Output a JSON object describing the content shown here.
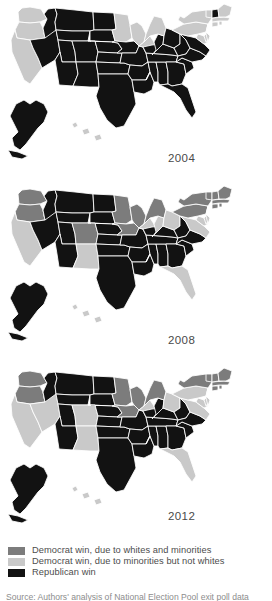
{
  "figure": {
    "caption": "Source: Authors' analysis of National Election Pool exit poll data"
  },
  "colors": {
    "dem_whites_and_minorities": "#7c7c7c",
    "dem_minorities_not_whites": "#c9c9c9",
    "republican": "#121212",
    "border": "#ffffff",
    "background": "#ffffff",
    "text": "#4d4d4d"
  },
  "legend": {
    "name": "map-legend",
    "items": [
      {
        "swatch_color": "#7c7c7c",
        "label": "Democrat win, due to whites and minorities",
        "key": "dem_whites_and_minorities"
      },
      {
        "swatch_color": "#c9c9c9",
        "label": "Democrat win, due to minorities but not whites",
        "key": "dem_minorities_not_whites"
      },
      {
        "swatch_color": "#121212",
        "label": "Republican win",
        "key": "republican"
      }
    ]
  },
  "panels": [
    {
      "id": "panel-2004",
      "year_label": "2004",
      "states": {
        "WA": "dem_minorities_not_whites",
        "OR": "dem_minorities_not_whites",
        "CA": "dem_minorities_not_whites",
        "NV": "republican",
        "ID": "republican",
        "MT": "republican",
        "WY": "republican",
        "UT": "republican",
        "AZ": "republican",
        "CO": "republican",
        "NM": "republican",
        "ND": "republican",
        "SD": "republican",
        "NE": "republican",
        "KS": "republican",
        "OK": "republican",
        "TX": "republican",
        "MN": "dem_minorities_not_whites",
        "IA": "republican",
        "MO": "republican",
        "AR": "republican",
        "LA": "republican",
        "WI": "dem_minorities_not_whites",
        "IL": "dem_minorities_not_whites",
        "MS": "republican",
        "AL": "republican",
        "TN": "republican",
        "KY": "republican",
        "IN": "republican",
        "MI": "dem_minorities_not_whites",
        "OH": "republican",
        "WV": "republican",
        "GA": "republican",
        "FL": "republican",
        "SC": "republican",
        "NC": "republican",
        "VA": "republican",
        "MD": "dem_minorities_not_whites",
        "DE": "dem_minorities_not_whites",
        "PA": "dem_minorities_not_whites",
        "NJ": "dem_minorities_not_whites",
        "NY": "dem_minorities_not_whites",
        "CT": "dem_minorities_not_whites",
        "RI": "dem_minorities_not_whites",
        "MA": "dem_minorities_not_whites",
        "VT": "dem_minorities_not_whites",
        "NH": "republican",
        "ME": "dem_minorities_not_whites",
        "AK": "republican",
        "HI": "dem_minorities_not_whites"
      }
    },
    {
      "id": "panel-2008",
      "year_label": "2008",
      "states": {
        "WA": "dem_whites_and_minorities",
        "OR": "dem_whites_and_minorities",
        "CA": "dem_minorities_not_whites",
        "NV": "republican",
        "ID": "republican",
        "MT": "republican",
        "WY": "republican",
        "UT": "republican",
        "AZ": "republican",
        "CO": "dem_whites_and_minorities",
        "NM": "dem_minorities_not_whites",
        "ND": "republican",
        "SD": "republican",
        "NE": "republican",
        "KS": "republican",
        "OK": "republican",
        "TX": "republican",
        "MN": "dem_whites_and_minorities",
        "IA": "dem_whites_and_minorities",
        "MO": "republican",
        "AR": "republican",
        "LA": "republican",
        "WI": "dem_whites_and_minorities",
        "IL": "dem_minorities_not_whites",
        "MS": "republican",
        "AL": "republican",
        "TN": "republican",
        "KY": "republican",
        "IN": "dem_minorities_not_whites",
        "MI": "dem_whites_and_minorities",
        "OH": "dem_minorities_not_whites",
        "WV": "republican",
        "GA": "republican",
        "FL": "dem_minorities_not_whites",
        "SC": "republican",
        "NC": "republican",
        "VA": "dem_minorities_not_whites",
        "MD": "dem_minorities_not_whites",
        "DE": "dem_minorities_not_whites",
        "PA": "dem_whites_and_minorities",
        "NJ": "dem_minorities_not_whites",
        "NY": "dem_whites_and_minorities",
        "CT": "dem_whites_and_minorities",
        "RI": "dem_whites_and_minorities",
        "MA": "dem_whites_and_minorities",
        "VT": "dem_whites_and_minorities",
        "NH": "dem_whites_and_minorities",
        "ME": "dem_whites_and_minorities",
        "AK": "republican",
        "HI": "dem_minorities_not_whites"
      }
    },
    {
      "id": "panel-2012",
      "year_label": "2012",
      "states": {
        "WA": "dem_whites_and_minorities",
        "OR": "dem_whites_and_minorities",
        "CA": "dem_minorities_not_whites",
        "NV": "dem_minorities_not_whites",
        "ID": "republican",
        "MT": "republican",
        "WY": "republican",
        "UT": "republican",
        "AZ": "republican",
        "CO": "dem_minorities_not_whites",
        "NM": "dem_minorities_not_whites",
        "ND": "republican",
        "SD": "republican",
        "NE": "republican",
        "KS": "republican",
        "OK": "republican",
        "TX": "republican",
        "MN": "dem_whites_and_minorities",
        "IA": "dem_whites_and_minorities",
        "MO": "republican",
        "AR": "republican",
        "LA": "republican",
        "WI": "dem_whites_and_minorities",
        "IL": "dem_minorities_not_whites",
        "MS": "republican",
        "AL": "republican",
        "TN": "republican",
        "KY": "republican",
        "IN": "republican",
        "MI": "dem_whites_and_minorities",
        "OH": "dem_minorities_not_whites",
        "WV": "republican",
        "GA": "republican",
        "FL": "dem_minorities_not_whites",
        "SC": "republican",
        "NC": "republican",
        "VA": "dem_minorities_not_whites",
        "MD": "dem_minorities_not_whites",
        "DE": "dem_minorities_not_whites",
        "PA": "dem_minorities_not_whites",
        "NJ": "dem_minorities_not_whites",
        "NY": "dem_whites_and_minorities",
        "CT": "dem_whites_and_minorities",
        "RI": "dem_whites_and_minorities",
        "MA": "dem_whites_and_minorities",
        "VT": "dem_whites_and_minorities",
        "NH": "dem_whites_and_minorities",
        "ME": "dem_whites_and_minorities",
        "AK": "republican",
        "HI": "dem_minorities_not_whites"
      }
    }
  ]
}
